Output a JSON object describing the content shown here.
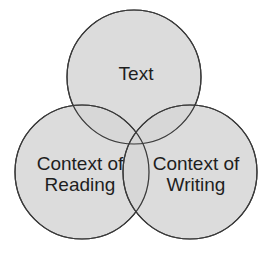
{
  "diagram": {
    "type": "venn",
    "fill_color": "#d6d6d6",
    "stroke_color": "#3a3a3a",
    "circles": [
      {
        "id": "text",
        "label_lines": [
          "Text"
        ],
        "cx": 134,
        "cy": 77,
        "r": 67
      },
      {
        "id": "reading",
        "label_lines": [
          "Context of",
          "Reading"
        ],
        "cx": 82,
        "cy": 172,
        "r": 67
      },
      {
        "id": "writing",
        "label_lines": [
          "Context of",
          "Writing"
        ],
        "cx": 190,
        "cy": 172,
        "r": 67
      }
    ]
  }
}
